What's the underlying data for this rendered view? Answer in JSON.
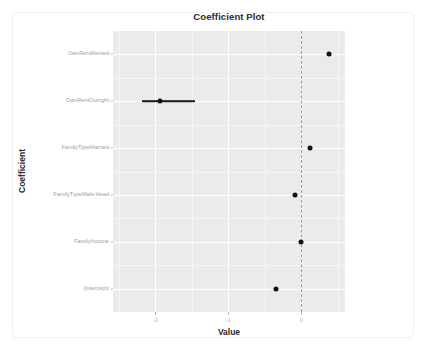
{
  "chart_data": {
    "type": "scatter",
    "title": "Coefficient Plot",
    "xlabel": "Value",
    "ylabel": "Coefficient",
    "xlim": [
      -2.58,
      0.6
    ],
    "xticks": [
      -2,
      -1,
      0
    ],
    "xtick_labels": [
      "-2",
      "-1",
      "0"
    ],
    "grid": true,
    "legend": "none",
    "reference_line": {
      "value": 0,
      "style": "dashed",
      "color": "#9a9a9a"
    },
    "categories": [
      "OwnRentRented",
      "OwnRentOutright",
      "FamilyTypeMarried",
      "FamilyTypeMale Head",
      "FamilyIncome",
      "(Intercept)"
    ],
    "values": [
      0.38,
      -1.93,
      0.12,
      -0.08,
      0.0,
      -0.35
    ],
    "points": [
      {
        "label": "OwnRentRented",
        "value": 0.38,
        "ci_low": 0.36,
        "ci_high": 0.4,
        "has_visible_error_bar": false
      },
      {
        "label": "OwnRentOutright",
        "value": -1.93,
        "ci_low": -2.18,
        "ci_high": -1.46,
        "has_visible_error_bar": true
      },
      {
        "label": "FamilyTypeMarried",
        "value": 0.12,
        "ci_low": 0.1,
        "ci_high": 0.14,
        "has_visible_error_bar": false
      },
      {
        "label": "FamilyTypeMale Head",
        "value": -0.08,
        "ci_low": -0.11,
        "ci_high": -0.05,
        "has_visible_error_bar": false
      },
      {
        "label": "FamilyIncome",
        "value": 0.0,
        "ci_low": -0.01,
        "ci_high": 0.01,
        "has_visible_error_bar": false
      },
      {
        "label": "(Intercept)",
        "value": -0.35,
        "ci_low": -0.37,
        "ci_high": -0.33,
        "has_visible_error_bar": false
      }
    ],
    "colors": {
      "panel_background": "#ebebeb",
      "gridline_major": "#ffffff",
      "gridline_minor": "#f6f6f6",
      "point": "#111111",
      "error_bar": "#1a1a1a",
      "axis_text": "#9e9e9e",
      "title_text": "#2b2b2b"
    }
  }
}
